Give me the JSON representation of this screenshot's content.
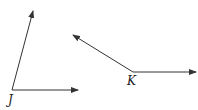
{
  "diagram": {
    "angles": [
      {
        "name": "J",
        "vertex": [
          12,
          90
        ],
        "rays": [
          [
            33,
            11
          ],
          [
            78,
            90
          ]
        ]
      },
      {
        "name": "K",
        "vertex": [
          133,
          72
        ],
        "rays": [
          [
            73,
            35
          ],
          [
            196,
            72
          ]
        ]
      }
    ],
    "labels": {
      "J": "J",
      "K": "K"
    },
    "line_color": "#333333"
  }
}
